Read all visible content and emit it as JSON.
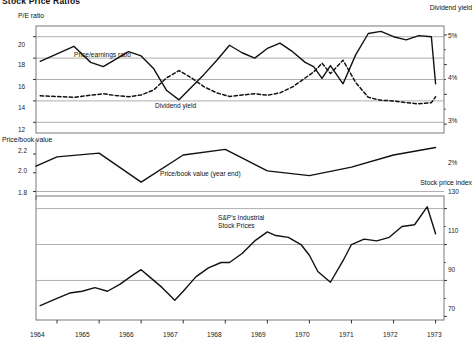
{
  "title": "Stock Price Ratios",
  "panels": {
    "top": {
      "left_axis_name": "P/E ratio",
      "right_axis_name": "Dividend yield",
      "left_ticks": [
        "20",
        "18",
        "16",
        "14",
        "12"
      ],
      "right_ticks": [
        "5%",
        "4%",
        "3%",
        "2%"
      ],
      "series_labels": [
        "Price/earnings ratio",
        "Dividend yield"
      ]
    },
    "middle": {
      "left_axis_name": "Price/book value",
      "left_ticks": [
        "2.2",
        "2.0",
        "1.8"
      ],
      "series_labels": [
        "Price/book value (year end)"
      ]
    },
    "bottom": {
      "right_axis_name": "Stock price index",
      "right_ticks": [
        "130",
        "110",
        "90",
        "70"
      ],
      "series_labels": [
        "S&P's Industrial",
        "Stock Prices"
      ]
    }
  },
  "x_axis": {
    "tick_labels": [
      "1964",
      "1965",
      "1966",
      "1967",
      "1968",
      "1969",
      "1970",
      "1971",
      "1972",
      "1973"
    ]
  },
  "colors": {
    "line": "#111111",
    "grid": "#9a9a9a",
    "axis": "#6b6b6b",
    "background": "#ffffff"
  },
  "chart_data": {
    "type": "line",
    "title": "Stock Price Ratios",
    "xlabel": "",
    "grid": true,
    "legend_position": "inline-annotations",
    "x": [
      "1963.5",
      "1964",
      "1964.5",
      "1965",
      "1965.5",
      "1966",
      "1966.5",
      "1967",
      "1967.5",
      "1968",
      "1968.5",
      "1969",
      "1969.5",
      "1970",
      "1970.5",
      "1971",
      "1971.5",
      "1972",
      "1972.5",
      "1973"
    ],
    "panels": [
      {
        "name": "Price/earnings ratio and Dividend yield",
        "ylabel": "P/E ratio",
        "ylim": [
          11,
          21
        ],
        "yticks": [
          12,
          14,
          16,
          18,
          20
        ],
        "y2label": "Dividend yield",
        "y2lim": [
          1.7,
          5.3
        ],
        "y2ticks": [
          2,
          3,
          4,
          5
        ],
        "series": [
          {
            "name": "Price/earnings ratio",
            "style": "solid",
            "axis": "left",
            "x": [
              "1963.6",
              "1964.0",
              "1964.4",
              "1964.8",
              "1965.1",
              "1965.4",
              "1965.7",
              "1966.0",
              "1966.3",
              "1966.6",
              "1966.9",
              "1967.2",
              "1967.5",
              "1967.8",
              "1968.1",
              "1968.4",
              "1968.7",
              "1969.0",
              "1969.3",
              "1969.6",
              "1969.9",
              "1970.1",
              "1970.3",
              "1970.5",
              "1970.8",
              "1971.1",
              "1971.4",
              "1971.7",
              "1972.0",
              "1972.3",
              "1972.6",
              "1972.9",
              "1973.0"
            ],
            "values": [
              17.7,
              18.4,
              19.1,
              17.6,
              17.2,
              17.9,
              18.6,
              18.2,
              17.0,
              15.0,
              14.1,
              15.3,
              16.5,
              17.8,
              19.2,
              18.5,
              18.0,
              18.9,
              19.4,
              18.6,
              17.6,
              17.2,
              16.1,
              17.3,
              15.6,
              18.3,
              20.3,
              20.5,
              20.0,
              19.7,
              20.1,
              20.0,
              15.6
            ]
          },
          {
            "name": "Dividend yield",
            "style": "dashed",
            "axis": "right",
            "x": [
              "1963.6",
              "1964.0",
              "1964.4",
              "1964.8",
              "1965.1",
              "1965.4",
              "1965.7",
              "1966.0",
              "1966.3",
              "1966.6",
              "1966.9",
              "1967.2",
              "1967.5",
              "1967.8",
              "1968.1",
              "1968.4",
              "1968.7",
              "1969.0",
              "1969.3",
              "1969.6",
              "1969.9",
              "1970.1",
              "1970.3",
              "1970.5",
              "1970.8",
              "1971.1",
              "1971.4",
              "1971.7",
              "1972.0",
              "1972.3",
              "1972.6",
              "1972.9",
              "1973.0"
            ],
            "values": [
              2.95,
              2.93,
              2.9,
              2.97,
              3.02,
              2.96,
              2.92,
              2.98,
              3.15,
              3.55,
              3.8,
              3.55,
              3.25,
              3.05,
              2.93,
              2.98,
              3.02,
              2.97,
              3.05,
              3.25,
              3.55,
              3.75,
              4.05,
              3.7,
              4.15,
              3.4,
              2.9,
              2.8,
              2.78,
              2.72,
              2.68,
              2.72,
              2.92
            ]
          }
        ]
      },
      {
        "name": "Price/book value",
        "ylabel": "Price/book value",
        "ylim": [
          1.72,
          2.35
        ],
        "yticks": [
          1.8,
          2.0,
          2.2
        ],
        "series": [
          {
            "name": "Price/book value (year end)",
            "style": "solid",
            "axis": "left",
            "x": [
              "1963.5",
              "1964",
              "1965",
              "1966",
              "1967",
              "1968",
              "1969",
              "1970",
              "1971",
              "1972",
              "1973"
            ],
            "values": [
              2.07,
              2.17,
              2.21,
              1.9,
              2.19,
              2.25,
              2.02,
              1.97,
              2.06,
              2.19,
              2.27
            ]
          }
        ]
      },
      {
        "name": "S&P's Industrial Stock Prices",
        "y2label": "Stock price index",
        "y2lim": [
          68,
          137
        ],
        "y2ticks": [
          70,
          90,
          110,
          130
        ],
        "series": [
          {
            "name": "S&P's Industrial Stock Prices",
            "style": "solid",
            "axis": "right",
            "x": [
              "1963.6",
              "1964.0",
              "1964.3",
              "1964.6",
              "1964.9",
              "1965.2",
              "1965.5",
              "1965.8",
              "1966.0",
              "1966.2",
              "1966.5",
              "1966.8",
              "1967.0",
              "1967.3",
              "1967.6",
              "1967.9",
              "1968.1",
              "1968.4",
              "1968.7",
              "1969.0",
              "1969.2",
              "1969.5",
              "1969.8",
              "1970.0",
              "1970.2",
              "1970.5",
              "1970.8",
              "1971.0",
              "1971.3",
              "1971.6",
              "1971.9",
              "1972.2",
              "1972.5",
              "1972.8",
              "1973.0"
            ],
            "values": [
              76,
              80,
              83,
              84,
              86,
              84,
              88,
              93,
              96,
              92,
              86,
              79,
              84,
              92,
              97,
              100,
              100,
              105,
              112,
              117,
              115,
              114,
              110,
              104,
              95,
              89,
              101,
              110,
              113,
              112,
              114,
              120,
              121,
              131,
              116
            ]
          }
        ]
      }
    ]
  }
}
